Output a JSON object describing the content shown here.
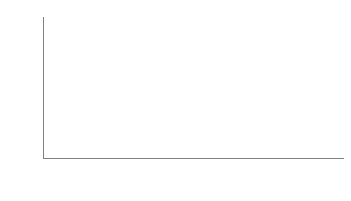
{
  "chart_data": {
    "type": "bar",
    "subtype": "stacked-bar",
    "title": "",
    "xlabel": "",
    "ylabel": "Share of budget for subsidies (%)",
    "ylim": [
      0,
      35
    ],
    "ytick_step": 5,
    "yticks": [
      35,
      30,
      25,
      20,
      15,
      10,
      5,
      0
    ],
    "grid": false,
    "legend_position": "bottom",
    "categories": [
      "2013",
      "2014",
      "2015",
      "2016",
      "2017",
      "Average"
    ],
    "series": [
      {
        "name": "Subsidies on capital investments",
        "color": "#c3c3c3",
        "values": [
          7,
          8,
          6,
          6,
          7,
          7
        ],
        "labels": [
          "7",
          "8",
          "6",
          "6",
          "7",
          "7"
        ],
        "stack_order": "top"
      },
      {
        "name": "Subsidies on current expenditure",
        "color": "#a3a3a3",
        "values": [
          25,
          20,
          17,
          17,
          19,
          19
        ],
        "labels": [
          "25",
          "20",
          "17",
          "17",
          "19",
          "19"
        ],
        "stack_order": "bottom"
      }
    ],
    "totals": [
      31,
      28.5,
      23,
      22.7,
      25.5,
      26
    ],
    "segment_boundaries": [
      24.5,
      20.0,
      16.7,
      17.0,
      19.3,
      19.4
    ]
  },
  "axis": {
    "y_title": "Share of budget for subsidies (%)",
    "y_ticks": [
      {
        "label": "35",
        "value": 35
      },
      {
        "label": "30",
        "value": 30
      },
      {
        "label": "25",
        "value": 25
      },
      {
        "label": "20",
        "value": 20
      },
      {
        "label": "15",
        "value": 15
      },
      {
        "label": "10",
        "value": 10
      },
      {
        "label": "5",
        "value": 5
      },
      {
        "label": "0",
        "value": 0
      }
    ],
    "x_labels": [
      "2013",
      "2014",
      "2015",
      "2016",
      "2017",
      "Average"
    ]
  },
  "legend": {
    "items": [
      {
        "label": "Subsidies on capital investments",
        "color": "#c3c3c3"
      },
      {
        "label": "Subsidies on current expenditure",
        "color": "#a3a3a3"
      }
    ]
  },
  "colors": {
    "capital_investments": "#c3c3c3",
    "current_expenditure": "#a3a3a3",
    "axis": "#808080",
    "text": "#262626",
    "background": "#ffffff"
  }
}
